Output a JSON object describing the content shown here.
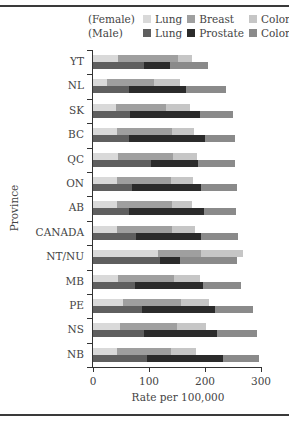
{
  "chart_data": {
    "type": "bar",
    "orientation": "horizontal",
    "stacked": true,
    "title": "",
    "xlabel": "Rate per 100,000",
    "ylabel": "Province",
    "xlim": [
      0,
      300
    ],
    "xticks": [
      "0",
      "100",
      "200",
      "300"
    ],
    "categories": [
      "YT",
      "NL",
      "SK",
      "BC",
      "QC",
      "ON",
      "AB",
      "CANADA",
      "NT/NU",
      "MB",
      "PE",
      "NS",
      "NB"
    ],
    "legend": {
      "female_group_label": "(Female)",
      "male_group_label": "(Male)",
      "female": [
        "Lung",
        "Breast",
        "Colorectal"
      ],
      "male": [
        "Lung",
        "Prostate",
        "Colorectal"
      ]
    },
    "series": [
      {
        "name": "Female Lung",
        "group": "Female",
        "color": "#d9d9d9",
        "values": [
          45,
          25,
          41,
          43,
          45,
          43,
          43,
          43,
          116,
          45,
          54,
          48,
          43
        ]
      },
      {
        "name": "Female Breast",
        "group": "Female",
        "color": "#9f9f9f",
        "values": [
          107,
          84,
          89,
          98,
          98,
          96,
          98,
          98,
          77,
          100,
          104,
          102,
          96
        ]
      },
      {
        "name": "Female Colorectal",
        "group": "Female",
        "color": "#c6c6c6",
        "values": [
          25,
          46,
          43,
          39,
          43,
          39,
          36,
          41,
          75,
          46,
          50,
          52,
          45
        ]
      },
      {
        "name": "Male Lung",
        "group": "Male",
        "color": "#5f5f5f",
        "values": [
          91,
          64,
          66,
          64,
          104,
          70,
          64,
          77,
          120,
          75,
          88,
          91,
          96
        ]
      },
      {
        "name": "Male Prostate",
        "group": "Male",
        "color": "#2b2b2b",
        "values": [
          46,
          102,
          125,
          136,
          84,
          123,
          134,
          116,
          36,
          121,
          129,
          130,
          136
        ]
      },
      {
        "name": "Male Colorectal",
        "group": "Male",
        "color": "#8a8a8a",
        "values": [
          68,
          71,
          59,
          54,
          66,
          64,
          57,
          66,
          102,
          68,
          68,
          71,
          64
        ]
      }
    ],
    "grid": false,
    "legend_position": "top-right"
  }
}
